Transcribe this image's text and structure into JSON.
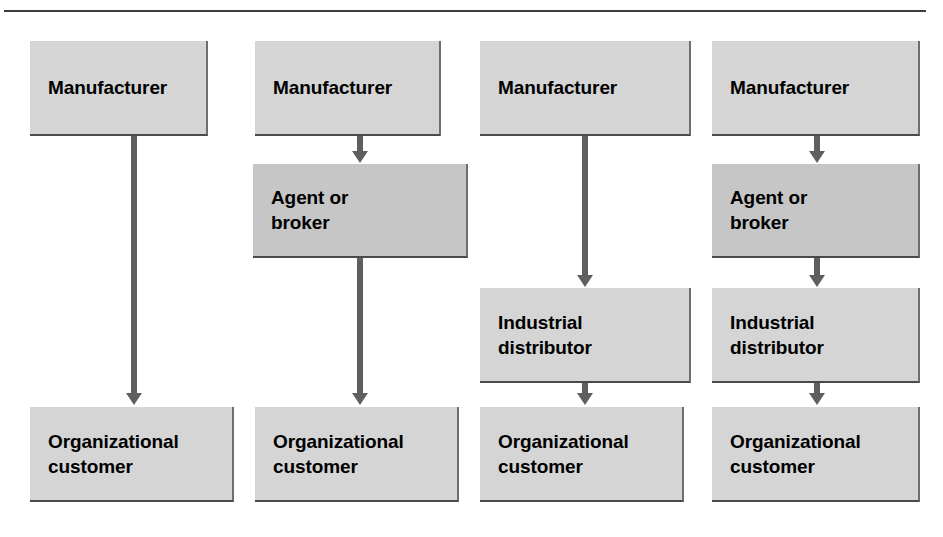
{
  "figure": {
    "background_color": "#ffffff",
    "rule_color": "#3c3c3c",
    "box_color_light": "#d5d5d5",
    "box_color_dark": "#c6c6c6",
    "arrow_color": "#5f5f5f",
    "text_color": "#000000"
  },
  "columns": [
    {
      "id": "channel-1",
      "nodes": [
        {
          "id": "manufacturer",
          "lines": [
            "Manufacturer"
          ],
          "shade": "light"
        },
        {
          "id": "organizational-customer",
          "lines": [
            "Organizational",
            "customer"
          ],
          "shade": "light"
        }
      ],
      "arrows": 1
    },
    {
      "id": "channel-2",
      "nodes": [
        {
          "id": "manufacturer",
          "lines": [
            "Manufacturer"
          ],
          "shade": "light"
        },
        {
          "id": "agent-or-broker",
          "lines": [
            "Agent or",
            "broker"
          ],
          "shade": "dark"
        },
        {
          "id": "organizational-customer",
          "lines": [
            "Organizational",
            "customer"
          ],
          "shade": "light"
        }
      ],
      "arrows": 2
    },
    {
      "id": "channel-3",
      "nodes": [
        {
          "id": "manufacturer",
          "lines": [
            "Manufacturer"
          ],
          "shade": "light"
        },
        {
          "id": "industrial-distributor",
          "lines": [
            "Industrial",
            "distributor"
          ],
          "shade": "light"
        },
        {
          "id": "organizational-customer",
          "lines": [
            "Organizational",
            "customer"
          ],
          "shade": "light"
        }
      ],
      "arrows": 2
    },
    {
      "id": "channel-4",
      "nodes": [
        {
          "id": "manufacturer",
          "lines": [
            "Manufacturer"
          ],
          "shade": "light"
        },
        {
          "id": "agent-or-broker",
          "lines": [
            "Agent or",
            "broker"
          ],
          "shade": "dark"
        },
        {
          "id": "industrial-distributor",
          "lines": [
            "Industrial",
            "distributor"
          ],
          "shade": "light"
        },
        {
          "id": "organizational-customer",
          "lines": [
            "Organizational",
            "customer"
          ],
          "shade": "light"
        }
      ],
      "arrows": 3
    }
  ],
  "labels": {
    "c1_n1_l1": "Manufacturer",
    "c1_n2_l1": "Organizational",
    "c1_n2_l2": "customer",
    "c2_n1_l1": "Manufacturer",
    "c2_n2_l1": "Agent or",
    "c2_n2_l2": "broker",
    "c2_n3_l1": "Organizational",
    "c2_n3_l2": "customer",
    "c3_n1_l1": "Manufacturer",
    "c3_n2_l1": "Industrial",
    "c3_n2_l2": "distributor",
    "c3_n3_l1": "Organizational",
    "c3_n3_l2": "customer",
    "c4_n1_l1": "Manufacturer",
    "c4_n2_l1": "Agent or",
    "c4_n2_l2": "broker",
    "c4_n3_l1": "Industrial",
    "c4_n3_l2": "distributor",
    "c4_n4_l1": "Organizational",
    "c4_n4_l2": "customer"
  }
}
